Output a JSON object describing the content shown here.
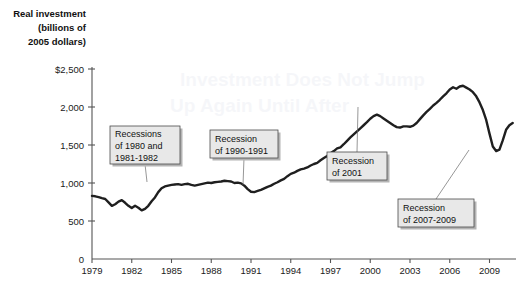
{
  "chart_data": {
    "type": "line",
    "title": "Real investment (billions of 2005 dollars)",
    "title_lines": [
      "Real investment",
      "(billions of",
      "2005 dollars)"
    ],
    "xlabel": "",
    "ylabel": "Real investment (billions of 2005 dollars)",
    "xlim": [
      1979,
      2011
    ],
    "ylim": [
      0,
      2500
    ],
    "grid": false,
    "legend": "none",
    "x_tick_labels": [
      "1979",
      "1982",
      "1985",
      "1988",
      "1991",
      "1994",
      "1997",
      "2000",
      "2003",
      "2006",
      "2009"
    ],
    "x_ticks": [
      1979,
      1982,
      1985,
      1988,
      1991,
      1994,
      1997,
      2000,
      2003,
      2006,
      2009
    ],
    "y_tick_labels": [
      "0",
      "500",
      "1,000",
      "1,500",
      "2,000",
      "$2,500"
    ],
    "y_ticks": [
      0,
      500,
      1000,
      1500,
      2000,
      2500
    ],
    "series": [
      {
        "name": "Real investment",
        "x": [
          1979.0,
          1979.25,
          1979.5,
          1979.75,
          1980.0,
          1980.25,
          1980.5,
          1980.75,
          1981.0,
          1981.25,
          1981.5,
          1981.75,
          1982.0,
          1982.25,
          1982.5,
          1982.75,
          1983.0,
          1983.25,
          1983.5,
          1983.75,
          1984.0,
          1984.25,
          1984.5,
          1984.75,
          1985.0,
          1985.25,
          1985.5,
          1985.75,
          1986.0,
          1986.25,
          1986.5,
          1986.75,
          1987.0,
          1987.25,
          1987.5,
          1987.75,
          1988.0,
          1988.25,
          1988.5,
          1988.75,
          1989.0,
          1989.25,
          1989.5,
          1989.75,
          1990.0,
          1990.25,
          1990.5,
          1990.75,
          1991.0,
          1991.25,
          1991.5,
          1991.75,
          1992.0,
          1992.25,
          1992.5,
          1992.75,
          1993.0,
          1993.25,
          1993.5,
          1993.75,
          1994.0,
          1994.25,
          1994.5,
          1994.75,
          1995.0,
          1995.25,
          1995.5,
          1995.75,
          1996.0,
          1996.25,
          1996.5,
          1996.75,
          1997.0,
          1997.25,
          1997.5,
          1997.75,
          1998.0,
          1998.25,
          1998.5,
          1998.75,
          1999.0,
          1999.25,
          1999.5,
          1999.75,
          2000.0,
          2000.25,
          2000.5,
          2000.75,
          2001.0,
          2001.25,
          2001.5,
          2001.75,
          2002.0,
          2002.25,
          2002.5,
          2002.75,
          2003.0,
          2003.25,
          2003.5,
          2003.75,
          2004.0,
          2004.25,
          2004.5,
          2004.75,
          2005.0,
          2005.25,
          2005.5,
          2005.75,
          2006.0,
          2006.25,
          2006.5,
          2006.75,
          2007.0,
          2007.25,
          2007.5,
          2007.75,
          2008.0,
          2008.25,
          2008.5,
          2008.75,
          2009.0,
          2009.25,
          2009.5,
          2009.75,
          2010.0,
          2010.25,
          2010.5,
          2010.75
        ],
        "values": [
          830,
          825,
          815,
          800,
          790,
          745,
          700,
          720,
          755,
          775,
          740,
          700,
          670,
          700,
          675,
          640,
          660,
          700,
          760,
          810,
          880,
          930,
          955,
          965,
          975,
          980,
          985,
          975,
          985,
          990,
          975,
          965,
          975,
          985,
          995,
          1005,
          1000,
          1010,
          1015,
          1020,
          1030,
          1025,
          1020,
          1000,
          1005,
          995,
          965,
          920,
          885,
          880,
          895,
          910,
          930,
          950,
          965,
          990,
          1010,
          1035,
          1055,
          1090,
          1120,
          1135,
          1160,
          1180,
          1190,
          1205,
          1230,
          1250,
          1265,
          1300,
          1330,
          1355,
          1390,
          1420,
          1455,
          1470,
          1510,
          1555,
          1600,
          1640,
          1680,
          1720,
          1760,
          1800,
          1845,
          1880,
          1900,
          1880,
          1850,
          1820,
          1790,
          1760,
          1735,
          1730,
          1745,
          1745,
          1740,
          1755,
          1790,
          1840,
          1890,
          1935,
          1975,
          2020,
          2055,
          2095,
          2140,
          2180,
          2230,
          2260,
          2240,
          2270,
          2280,
          2255,
          2230,
          2195,
          2140,
          2060,
          1960,
          1830,
          1650,
          1480,
          1420,
          1440,
          1560,
          1700,
          1760,
          1790
        ]
      }
    ],
    "annotations": [
      {
        "id": "recessions-1980-1982",
        "lines": [
          "Recessions",
          "of 1980 and",
          "1981-1982"
        ],
        "box_x": 110,
        "box_y": 126,
        "box_w": 70,
        "box_h": 38,
        "anchor_x": 147,
        "anchor_y": 182
      },
      {
        "id": "recession-1990-1991",
        "lines": [
          "Recession",
          "of 1990-1991"
        ],
        "box_x": 210,
        "box_y": 130,
        "box_w": 68,
        "box_h": 28,
        "anchor_x": 243,
        "anchor_y": 185
      },
      {
        "id": "recession-2001",
        "lines": [
          "Recession",
          "of 2001"
        ],
        "box_x": 327,
        "box_y": 152,
        "box_w": 60,
        "box_h": 28,
        "anchor_x": 358,
        "anchor_y": 107
      },
      {
        "id": "recession-2007-2009",
        "lines": [
          "Recession",
          "of 2007-2009"
        ],
        "box_x": 398,
        "box_y": 199,
        "box_w": 76,
        "box_h": 28,
        "anchor_x": 469,
        "anchor_y": 150
      }
    ]
  }
}
